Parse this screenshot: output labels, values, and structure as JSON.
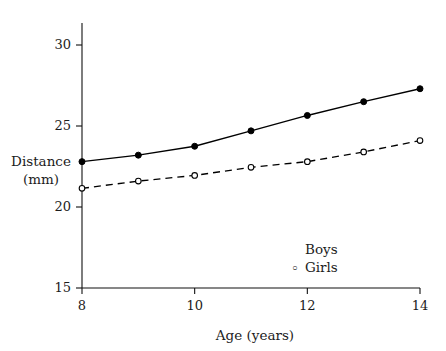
{
  "chart_data": {
    "type": "line",
    "title": "",
    "xlabel": "Age (years)",
    "ylabel": "Distance\n(mm)",
    "ylabel_line1": "Distance",
    "ylabel_line2": "(mm)",
    "x": [
      8,
      9,
      10,
      11,
      12,
      13,
      14
    ],
    "xlim": [
      8,
      14
    ],
    "ylim": [
      15,
      31.2
    ],
    "xticks": [
      8,
      10,
      12,
      14
    ],
    "xtick_labels": [
      "8",
      "10",
      "12",
      "14"
    ],
    "yticks": [
      15,
      20,
      25,
      30
    ],
    "ytick_labels": [
      "15",
      "20",
      "25",
      "30"
    ],
    "grid": false,
    "legend_position": "lower-right-inside",
    "series": [
      {
        "name": "Boys",
        "legend_label": "Boys",
        "marker": "filled-circle",
        "linestyle": "solid",
        "color": "#000000",
        "values": [
          22.8,
          23.2,
          23.75,
          24.7,
          25.65,
          26.5,
          27.3
        ]
      },
      {
        "name": "Girls",
        "legend_label": "Girls",
        "marker": "open-circle",
        "linestyle": "dashed",
        "color": "#000000",
        "values": [
          21.15,
          21.6,
          21.95,
          22.45,
          22.8,
          23.4,
          24.1
        ]
      }
    ]
  },
  "axis": {
    "x_axis_name": "x-axis",
    "y_axis_name": "y-axis"
  }
}
